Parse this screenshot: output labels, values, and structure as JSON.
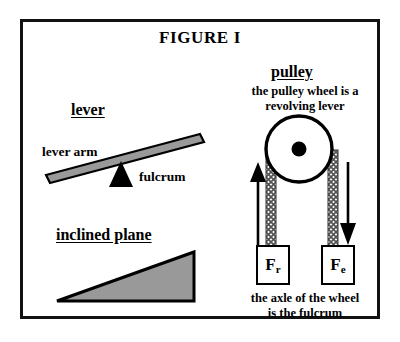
{
  "figure": {
    "title": "FIGURE I",
    "border_color": "#111111",
    "fill_gray": "#999999",
    "background": "#ffffff"
  },
  "lever": {
    "heading": "lever",
    "arm_label": "lever arm",
    "fulcrum_label": "fulcrum",
    "bar_color": "#999999",
    "fulcrum_color": "#000000"
  },
  "inclined_plane": {
    "heading": "inclined plane",
    "fill_color": "#999999",
    "outline_color": "#000000"
  },
  "pulley": {
    "heading": "pulley",
    "caption_top_line1": "the pulley wheel is a",
    "caption_top_line2": "revolving lever",
    "caption_bottom_line1": "the axle of the wheel",
    "caption_bottom_line2": "is the fulcrum",
    "wheel_color": "#ffffff",
    "axle_color": "#000000",
    "rope_color": "#808080",
    "left_force_symbol": "F",
    "left_force_subscript": "r",
    "right_force_symbol": "F",
    "right_force_subscript": "e",
    "left_arrow_direction": "up",
    "right_arrow_direction": "down"
  }
}
